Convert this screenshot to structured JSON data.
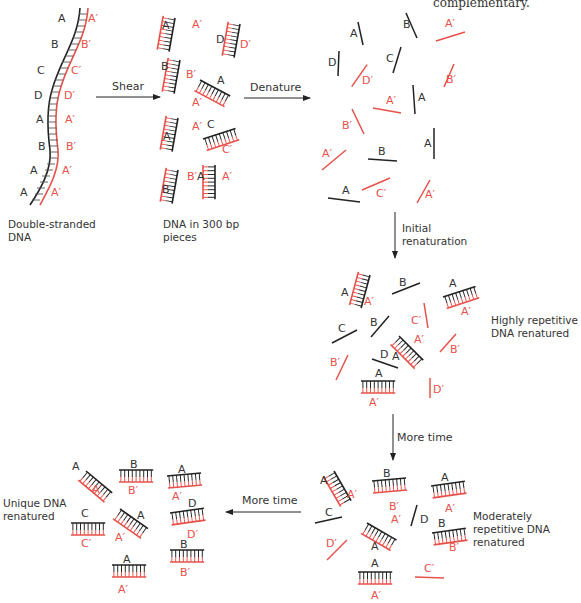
{
  "colors": {
    "strand": "#222222",
    "complement": "#e8504a",
    "text": "#333333"
  },
  "header_fragment": "complementary.",
  "captions": {
    "double_stranded": "Double-stranded DNA",
    "pieces": "DNA in 300 bp pieces",
    "highly": "Highly repetitive DNA renatured",
    "moderately": "Moderately repetitive DNA renatured",
    "unique": "Unique DNA renatured"
  },
  "arrows": {
    "shear": "Shear",
    "denature": "Denature",
    "initial": "Initial renaturation",
    "more_time_1": "More time",
    "more_time_2": "More time"
  },
  "stages": [
    {
      "name": "double-stranded",
      "strand_labels": [
        "A",
        "B",
        "C",
        "D",
        "A",
        "B",
        "A",
        "A"
      ],
      "complement_labels": [
        "A′",
        "B′",
        "C′",
        "D′",
        "A′",
        "B′",
        "A′",
        "A′"
      ]
    },
    {
      "name": "sheared",
      "duplexes": [
        [
          "A",
          "A′"
        ],
        [
          "D",
          "D′"
        ],
        [
          "B",
          "B′"
        ],
        [
          "A",
          "A′"
        ],
        [
          "A",
          "A′"
        ],
        [
          "C",
          "C′"
        ],
        [
          "B",
          "B′"
        ],
        [
          "A",
          "A′"
        ]
      ]
    },
    {
      "name": "denatured",
      "single_strands": [
        "A",
        "B",
        "A′",
        "D",
        "C",
        "D′",
        "B′",
        "A′",
        "A",
        "B′",
        "A′",
        "B",
        "A",
        "A",
        "C′",
        "A′"
      ]
    },
    {
      "name": "highly-repetitive-renatured",
      "duplexes": [
        [
          "A",
          "A′"
        ],
        [
          "A",
          "A′"
        ],
        [
          "A",
          "A′"
        ],
        [
          "A",
          "A′"
        ]
      ],
      "single_strands": [
        "B",
        "C",
        "B",
        "D",
        "C′",
        "B′",
        "B′",
        "D′"
      ]
    },
    {
      "name": "moderately-repetitive-renatured",
      "duplexes": [
        [
          "A",
          "A′"
        ],
        [
          "B",
          "B′"
        ],
        [
          "A",
          "A′"
        ],
        [
          "A",
          "A′"
        ],
        [
          "B",
          "B′"
        ],
        [
          "A",
          "A′"
        ]
      ],
      "single_strands": [
        "C",
        "D",
        "D′",
        "C′"
      ]
    },
    {
      "name": "unique-renatured",
      "duplexes": [
        [
          "A",
          "A′"
        ],
        [
          "B",
          "B′"
        ],
        [
          "A",
          "A′"
        ],
        [
          "C",
          "C′"
        ],
        [
          "A",
          "A′"
        ],
        [
          "D",
          "D′"
        ],
        [
          "B",
          "B′"
        ],
        [
          "A",
          "A′"
        ]
      ]
    }
  ]
}
